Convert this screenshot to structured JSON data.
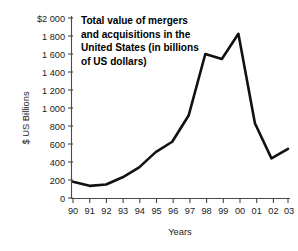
{
  "chart_data": {
    "type": "line",
    "title": "Total value of mergers and acquisitions in the United States (in billions of US dollars)",
    "title_lines": [
      "Total value of mergers",
      "and acquisitions in the",
      "United States (in billions",
      "of US dollars)"
    ],
    "xlabel": "Years",
    "ylabel": "$ US Billions",
    "categories": [
      "90",
      "91",
      "92",
      "93",
      "94",
      "95",
      "96",
      "97",
      "98",
      "99",
      "00",
      "01",
      "02",
      "03"
    ],
    "values": [
      180,
      135,
      150,
      230,
      340,
      510,
      625,
      920,
      1600,
      1545,
      1825,
      830,
      440,
      545
    ],
    "series": [
      {
        "name": "Total value of mergers and acquisitions",
        "values": [
          180,
          135,
          150,
          230,
          340,
          510,
          625,
          920,
          1600,
          1545,
          1825,
          830,
          440,
          545
        ]
      }
    ],
    "ylim": [
      0,
      2000
    ],
    "ytick_values": [
      0,
      200,
      400,
      600,
      800,
      1000,
      1200,
      1400,
      1600,
      1800,
      2000
    ],
    "ytick_labels": [
      "0",
      "200",
      "400",
      "600",
      "800",
      "1 000",
      "1 200",
      "1 400",
      "1 600",
      "1 800",
      "$2 000"
    ],
    "grid": false,
    "legend": false,
    "line_color": "#111111",
    "axis_color": "#4a4a4a",
    "background_color": "#ffffff"
  }
}
